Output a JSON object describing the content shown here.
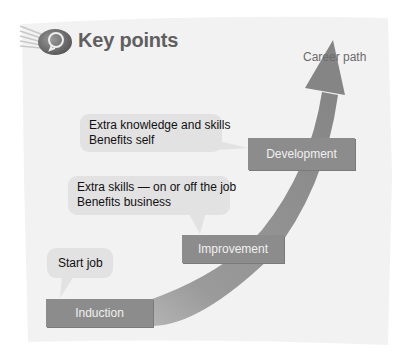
{
  "header": {
    "title": "Key points",
    "icon": "key-points-lightbulb-icon"
  },
  "diagram": {
    "arrow_label": "Career path",
    "stages": [
      {
        "label": "Induction"
      },
      {
        "label": "Improvement"
      },
      {
        "label": "Development"
      }
    ],
    "callouts": [
      {
        "lines": [
          "Start job"
        ]
      },
      {
        "lines": [
          "Extra skills — on or off the job",
          "Benefits business"
        ]
      },
      {
        "lines": [
          "Extra knowledge and skills",
          "Benefits self"
        ]
      }
    ]
  },
  "colors": {
    "paper": "#f2f2f2",
    "arrow": "#8a8a8a",
    "stage_box": "#8c8c8c",
    "callout": "#e2e2e2",
    "title": "#5f5f5f"
  }
}
